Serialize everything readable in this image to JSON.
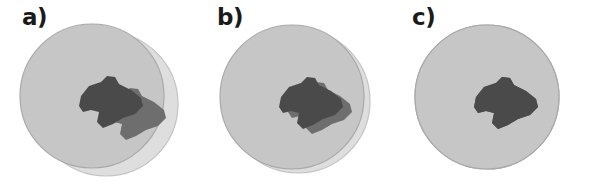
{
  "figure": {
    "background_color": "#ffffff",
    "width": 590,
    "height": 191
  },
  "colors": {
    "circle_back_fill": "#dedede",
    "circle_back_stroke": "#c3c3c3",
    "circle_front_fill": "#c6c6c6",
    "circle_front_stroke": "#a9a9a9",
    "blob_front_fill": "#4a4a4a",
    "blob_back_fill": "#6e6e6e",
    "label_color": "#1a1a1a",
    "background": "#ffffff"
  },
  "panels": [
    {
      "id": "a",
      "label": "a)",
      "description": "Two circles with a large misalignment offset; the rear circle is displaced down-right producing a wide light crescent, and the dark blob shows a matching doubled edge.",
      "offset_px": 16,
      "circles": [
        {
          "role": "back",
          "cx": 106,
          "cy": 104,
          "r": 72,
          "fill": "#dedede",
          "stroke": "#c3c3c3"
        },
        {
          "role": "front",
          "cx": 92,
          "cy": 96,
          "r": 72,
          "fill": "#c6c6c6",
          "stroke": "#a9a9a9"
        }
      ],
      "blobs": [
        {
          "role": "back",
          "dx": 9,
          "dy": 4,
          "fill": "#6e6e6e"
        },
        {
          "role": "front",
          "dx": 0,
          "dy": 0,
          "fill": "#4a4a4a"
        }
      ]
    },
    {
      "id": "b",
      "label": "b)",
      "description": "Two circles with a small misalignment offset; only a thin light crescent is visible at the lower-right, and the dark blob appears nearly single.",
      "offset_px": 7,
      "circles": [
        {
          "role": "back",
          "cx": 103,
          "cy": 101,
          "r": 72,
          "fill": "#dedede",
          "stroke": "#c3c3c3"
        },
        {
          "role": "front",
          "cx": 97,
          "cy": 97,
          "r": 72,
          "fill": "#c6c6c6",
          "stroke": "#a9a9a9"
        }
      ],
      "blobs": [
        {
          "role": "back",
          "dx": 3,
          "dy": 1,
          "fill": "#6e6e6e"
        },
        {
          "role": "front",
          "dx": 0,
          "dy": 0,
          "fill": "#4a4a4a"
        }
      ]
    },
    {
      "id": "c",
      "label": "c)",
      "description": "Perfect registration: the two circles coincide exactly so only one circle and one dark blob are seen.",
      "offset_px": 0,
      "circles": [
        {
          "role": "back",
          "cx": 97,
          "cy": 97,
          "r": 72,
          "fill": "#c6c6c6",
          "stroke": "#a9a9a9"
        },
        {
          "role": "front",
          "cx": 97,
          "cy": 97,
          "r": 72,
          "fill": "#c6c6c6",
          "stroke": "#a9a9a9"
        }
      ],
      "blobs": [
        {
          "role": "back",
          "dx": 0,
          "dy": 0,
          "fill": "#4a4a4a"
        },
        {
          "role": "front",
          "dx": 0,
          "dy": 0,
          "fill": "#4a4a4a"
        }
      ]
    }
  ],
  "blob_path": "M 74 -22 L 80 -28 L 88 -27 L 92 -20 L 104 -14 L 114 -6 L 116 2 L 108 10 L 96 14 L 86 20 L 76 24 L 70 18 L 72 8 L 64 6 L 56 8 L 52 2 L 54 -8 L 62 -18 Z",
  "blob_points": "74,-22 80,-28 88,-27 92,-20 104,-14 114,-6 116,2 108,10 96,14 86,20 76,24 70,18 72,8 64,6 56,8 52,2 54,-8 62,-18"
}
